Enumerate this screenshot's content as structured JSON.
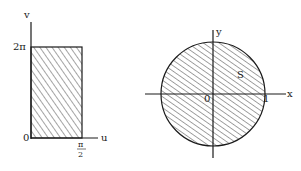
{
  "left_diagram": {
    "title": "uv-plane rectangle",
    "axes": {
      "vertical_label": "v",
      "horizontal_label": "u"
    },
    "labels": {
      "origin": "0",
      "top": "2π",
      "right_numerator": "π",
      "right_denominator": "2"
    },
    "region": {
      "shape": "rectangle",
      "u_range": [
        "0",
        "π/2"
      ],
      "v_range": [
        "0",
        "2π"
      ],
      "fill": "hatched"
    }
  },
  "right_diagram": {
    "title": "xy-plane disk",
    "axes": {
      "vertical_label": "y",
      "horizontal_label": "x"
    },
    "labels": {
      "origin": "0",
      "radius_mark": "1",
      "region_name": "S"
    },
    "region": {
      "shape": "disk",
      "radius": "1",
      "fill": "hatched"
    }
  },
  "colors": {
    "ink": "#1a1a1a",
    "background": "#ffffff"
  }
}
